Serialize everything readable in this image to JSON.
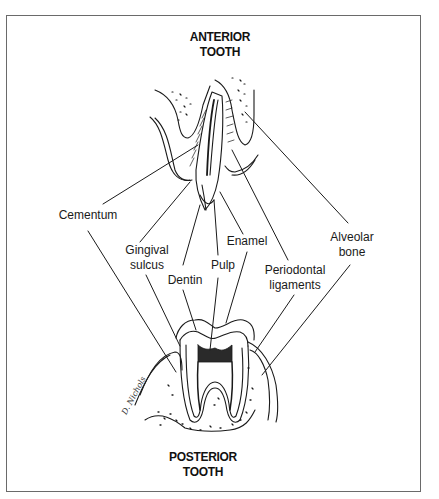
{
  "diagram": {
    "top_title": {
      "line1": "ANTERIOR",
      "line2": "TOOTH"
    },
    "bottom_title": {
      "line1": "POSTERIOR",
      "line2": "TOOTH"
    },
    "labels": [
      {
        "id": "cementum",
        "line1": "Cementum",
        "line2": ""
      },
      {
        "id": "gingival-sulcus",
        "line1": "Gingival",
        "line2": "sulcus"
      },
      {
        "id": "dentin",
        "line1": "Dentin",
        "line2": ""
      },
      {
        "id": "pulp",
        "line1": "Pulp",
        "line2": ""
      },
      {
        "id": "enamel",
        "line1": "Enamel",
        "line2": ""
      },
      {
        "id": "periodontal-ligaments",
        "line1": "Periodontal",
        "line2": "ligaments"
      },
      {
        "id": "alveolar-bone",
        "line1": "Alveolar",
        "line2": "bone"
      }
    ],
    "signature": "D. Nichols",
    "colors": {
      "line": "#1a1a1a",
      "frame": "#6a6a6a",
      "background": "#ffffff"
    }
  }
}
